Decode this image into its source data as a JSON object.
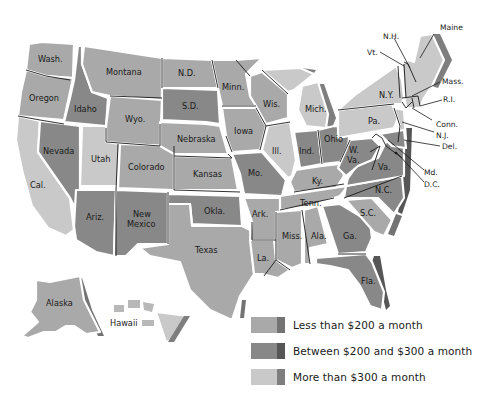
{
  "colors": {
    "less_200": "#a9a9a9",
    "less_200_edge": "#737373",
    "between_200_300": "#888888",
    "between_200_300_edge": "#565656",
    "more_300": "#c9c9c9",
    "more_300_edge": "#7e7e7e",
    "border": "#1a1a1a",
    "background": "#ffffff"
  },
  "legend": {
    "items": [
      {
        "key": "less_200",
        "label": "Less than $200 a month"
      },
      {
        "key": "between_200_300",
        "label": "Between $200 and $300 a month"
      },
      {
        "key": "more_300",
        "label": "More than $300 a month"
      }
    ]
  },
  "states": {
    "wash": {
      "label": "Wash.",
      "category": "less_200"
    },
    "oregon": {
      "label": "Oregon",
      "category": "less_200"
    },
    "cal": {
      "label": "Cal.",
      "category": "more_300"
    },
    "idaho": {
      "label": "Idaho",
      "category": "between_200_300"
    },
    "nevada": {
      "label": "Nevada",
      "category": "between_200_300"
    },
    "montana": {
      "label": "Montana",
      "category": "less_200"
    },
    "wyo": {
      "label": "Wyo.",
      "category": "less_200"
    },
    "utah": {
      "label": "Utah",
      "category": "more_300"
    },
    "colorado": {
      "label": "Colorado",
      "category": "less_200"
    },
    "ariz": {
      "label": "Ariz.",
      "category": "between_200_300"
    },
    "new_mexico_1": {
      "label": "New",
      "category": "between_200_300"
    },
    "new_mexico_2": {
      "label": "Mexico",
      "category": "between_200_300"
    },
    "nd": {
      "label": "N.D.",
      "category": "less_200"
    },
    "sd": {
      "label": "S.D.",
      "category": "between_200_300"
    },
    "nebraska": {
      "label": "Nebraska",
      "category": "less_200"
    },
    "kansas": {
      "label": "Kansas",
      "category": "less_200"
    },
    "okla": {
      "label": "Okla.",
      "category": "between_200_300"
    },
    "texas": {
      "label": "Texas",
      "category": "less_200"
    },
    "minn": {
      "label": "Minn.",
      "category": "less_200"
    },
    "iowa": {
      "label": "Iowa",
      "category": "less_200"
    },
    "mo": {
      "label": "Mo.",
      "category": "between_200_300"
    },
    "ark": {
      "label": "Ark.",
      "category": "less_200"
    },
    "la": {
      "label": "La.",
      "category": "less_200"
    },
    "wis": {
      "label": "Wis.",
      "category": "less_200"
    },
    "ill": {
      "label": "Ill.",
      "category": "more_300"
    },
    "mich": {
      "label": "Mich.",
      "category": "more_300"
    },
    "ind": {
      "label": "Ind.",
      "category": "between_200_300"
    },
    "ohio": {
      "label": "Ohio",
      "category": "between_200_300"
    },
    "ky": {
      "label": "Ky.",
      "category": "less_200"
    },
    "tenn": {
      "label": "Tenn.",
      "category": "less_200"
    },
    "miss": {
      "label": "Miss.",
      "category": "less_200"
    },
    "ala": {
      "label": "Ala.",
      "category": "less_200"
    },
    "ga": {
      "label": "Ga.",
      "category": "between_200_300"
    },
    "fla": {
      "label": "Fla.",
      "category": "between_200_300"
    },
    "sc": {
      "label": "S.C.",
      "category": "less_200"
    },
    "nc": {
      "label": "N.C.",
      "category": "between_200_300"
    },
    "va": {
      "label": "Va.",
      "category": "between_200_300"
    },
    "wva_1": {
      "label": "W.",
      "category": "between_200_300"
    },
    "wva_2": {
      "label": "Va.",
      "category": "between_200_300"
    },
    "pa": {
      "label": "Pa.",
      "category": "more_300"
    },
    "ny": {
      "label": "N.Y.",
      "category": "more_300"
    },
    "vt": {
      "label": "Vt.",
      "category": "more_300"
    },
    "nh": {
      "label": "N.H.",
      "category": "more_300"
    },
    "maine": {
      "label": "Maine",
      "category": "more_300"
    },
    "mass": {
      "label": "Mass.",
      "category": "more_300"
    },
    "ri": {
      "label": "R.I.",
      "category": "more_300"
    },
    "conn": {
      "label": "Conn.",
      "category": "more_300"
    },
    "nj": {
      "label": "N.J.",
      "category": "more_300"
    },
    "del": {
      "label": "Del.",
      "category": "more_300"
    },
    "md": {
      "label": "Md.",
      "category": "between_200_300"
    },
    "dc": {
      "label": "D.C.",
      "category": "between_200_300"
    },
    "alaska": {
      "label": "Alaska",
      "category": "less_200"
    },
    "hawaii": {
      "label": "Hawaii",
      "category": "more_300"
    }
  }
}
